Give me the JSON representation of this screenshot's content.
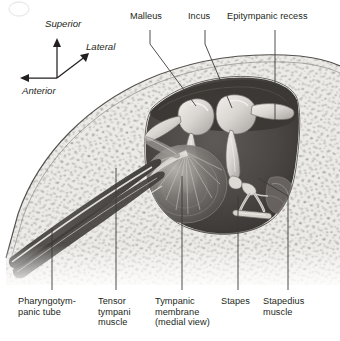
{
  "figure": {
    "style": "grayscale anatomical illustration",
    "colors": {
      "bone_light": "#e8e6e2",
      "bone_speckle": "#8d8a86",
      "cavity_dark": "#4a4744",
      "cavity_darkest": "#3a3734",
      "ossicle_light": "#e4e1dc",
      "outline": "#4d4a47",
      "text": "#231f20",
      "leader": "#3d3a38",
      "background": "#ffffff"
    }
  },
  "orientation": {
    "name": "orientation-compass",
    "axes": [
      {
        "key": "superior",
        "label": "Superior",
        "direction": "up"
      },
      {
        "key": "lateral",
        "label": "Lateral",
        "direction": "up-right"
      },
      {
        "key": "anterior",
        "label": "Anterior",
        "direction": "left"
      }
    ]
  },
  "labels": {
    "malleus": "Malleus",
    "incus": "Incus",
    "epitympanic_recess": "Epitympanic recess",
    "pharyngotympanic_tube": "Pharyngotym-\npanic tube",
    "tensor_tympani_muscle": "Tensor\ntympani\nmuscle",
    "tympanic_membrane": "Tympanic\nmembrane\n(medial view)",
    "stapes": "Stapes",
    "stapedius_muscle": "Stapedius\nmuscle"
  },
  "structures": [
    {
      "key": "malleus",
      "label": "Malleus",
      "position": "top-center-left"
    },
    {
      "key": "incus",
      "label": "Incus",
      "position": "top-center"
    },
    {
      "key": "epitympanic_recess",
      "label": "Epitympanic recess",
      "position": "top-right"
    },
    {
      "key": "pharyngotympanic_tube",
      "label": "Pharyngotympanic tube",
      "position": "bottom-left"
    },
    {
      "key": "tensor_tympani_muscle",
      "label": "Tensor tympani muscle",
      "position": "bottom-left-center"
    },
    {
      "key": "tympanic_membrane",
      "label": "Tympanic membrane (medial view)",
      "position": "bottom-center"
    },
    {
      "key": "stapes",
      "label": "Stapes",
      "position": "bottom-right-center"
    },
    {
      "key": "stapedius_muscle",
      "label": "Stapedius muscle",
      "position": "bottom-right"
    }
  ]
}
